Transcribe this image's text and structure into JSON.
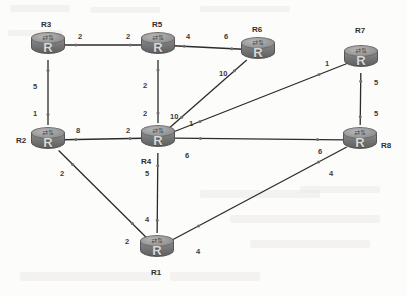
{
  "diagram": {
    "type": "network-graph",
    "canvas": {
      "width": 407,
      "height": 296
    },
    "background_color": "#fbfbfa",
    "node_color": "#7a7a7a",
    "edge_color": "#2b2b2b",
    "label_color": "#2f2f2f"
  },
  "nodes": [
    {
      "id": "R3",
      "label": "R3",
      "glyph": "R",
      "x": 48,
      "y": 45,
      "label_x": 41,
      "label_y": 20
    },
    {
      "id": "R5",
      "label": "R5",
      "glyph": "R",
      "x": 158,
      "y": 45,
      "label_x": 152,
      "label_y": 20
    },
    {
      "id": "R6",
      "label": "R6",
      "glyph": "R",
      "x": 258,
      "y": 50,
      "label_x": 252,
      "label_y": 25
    },
    {
      "id": "R7",
      "label": "R7",
      "glyph": "R",
      "x": 361,
      "y": 58,
      "label_x": 355,
      "label_y": 26
    },
    {
      "id": "R2",
      "label": "R2",
      "glyph": "R",
      "x": 48,
      "y": 140,
      "label_x": 16,
      "label_y": 136
    },
    {
      "id": "R4",
      "label": "R4",
      "glyph": "R",
      "x": 158,
      "y": 138,
      "label_x": 141,
      "label_y": 157
    },
    {
      "id": "R8",
      "label": "R8",
      "glyph": "R",
      "x": 360,
      "y": 140,
      "label_x": 381,
      "label_y": 141
    },
    {
      "id": "R1",
      "label": "R1",
      "glyph": "R",
      "x": 157,
      "y": 248,
      "label_x": 151,
      "label_y": 268
    }
  ],
  "links": [
    {
      "from": "R3",
      "to": "R5",
      "cost_from": "2",
      "cost_to": "2",
      "from_label_x": 78,
      "from_label_y": 33,
      "to_label_x": 126,
      "to_label_y": 33
    },
    {
      "from": "R5",
      "to": "R6",
      "cost_from": "4",
      "cost_to": "6",
      "from_label_x": 186,
      "from_label_y": 33,
      "to_label_x": 224,
      "to_label_y": 33
    },
    {
      "from": "R3",
      "to": "R2",
      "cost_from": "5",
      "cost_to": "1",
      "from_label_x": 33,
      "from_label_y": 83,
      "to_label_x": 33,
      "to_label_y": 110
    },
    {
      "from": "R5",
      "to": "R4",
      "cost_from": "2",
      "cost_to": "2",
      "from_label_x": 143,
      "from_label_y": 82,
      "to_label_x": 143,
      "to_label_y": 110
    },
    {
      "from": "R4",
      "to": "R6",
      "cost_from": "10",
      "cost_to": "10",
      "from_label_x": 170,
      "from_label_y": 113,
      "to_label_x": 219,
      "to_label_y": 70
    },
    {
      "from": "R4",
      "to": "R7",
      "cost_from": "1",
      "cost_to": "1",
      "from_label_x": 189,
      "from_label_y": 120,
      "to_label_x": 325,
      "to_label_y": 60
    },
    {
      "from": "R2",
      "to": "R4",
      "cost_from": "8",
      "cost_to": "2",
      "from_label_x": 76,
      "from_label_y": 127,
      "to_label_x": 126,
      "to_label_y": 127
    },
    {
      "from": "R4",
      "to": "R8",
      "cost_from": "6",
      "cost_to": "6",
      "from_label_x": 185,
      "from_label_y": 152,
      "to_label_x": 318,
      "to_label_y": 148
    },
    {
      "from": "R7",
      "to": "R8",
      "cost_from": "5",
      "cost_to": "5",
      "from_label_x": 374,
      "from_label_y": 79,
      "to_label_x": 374,
      "to_label_y": 110
    },
    {
      "from": "R4",
      "to": "R1",
      "cost_from": "5",
      "cost_to": "4",
      "from_label_x": 145,
      "from_label_y": 170,
      "to_label_x": 145,
      "to_label_y": 216
    },
    {
      "from": "R2",
      "to": "R1",
      "cost_from": "2",
      "cost_to": "2",
      "from_label_x": 60,
      "from_label_y": 170,
      "to_label_x": 125,
      "to_label_y": 238
    },
    {
      "from": "R1",
      "to": "R8",
      "cost_from": "4",
      "cost_to": "4",
      "from_label_x": 196,
      "from_label_y": 248,
      "to_label_x": 329,
      "to_label_y": 170
    }
  ]
}
